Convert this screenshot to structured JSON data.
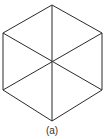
{
  "figure": {
    "caption": "(a)",
    "shape": "hexagon-with-diagonals",
    "stroke_color": "#2a2a2a",
    "vertices": [
      [
        52,
        5
      ],
      [
        102,
        33
      ],
      [
        102,
        90
      ],
      [
        52,
        121
      ],
      [
        3,
        90
      ],
      [
        3,
        33
      ]
    ],
    "center": [
      52,
      62
    ]
  }
}
